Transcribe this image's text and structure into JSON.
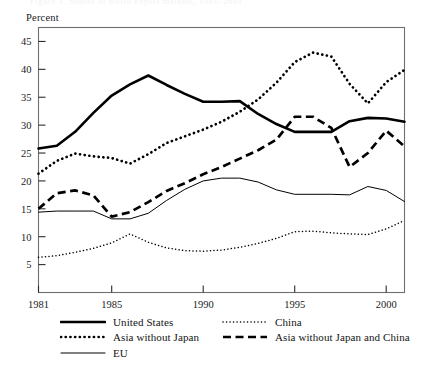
{
  "figure": {
    "ghost_title": "Figure 3. Shares of world export markets, 1981–2001",
    "y_axis_title": "Percent"
  },
  "legend": {
    "left_column": [
      {
        "label": "United States",
        "style": "solid-thick",
        "key": "united_states"
      },
      {
        "label": "Asia without Japan",
        "style": "dotted-thick",
        "key": "asia_without_japan"
      },
      {
        "label": "EU",
        "style": "solid-thin",
        "key": "eu"
      }
    ],
    "right_column": [
      {
        "label": "China",
        "style": "dotted-thin",
        "key": "china"
      },
      {
        "label": "Asia without Japan and China",
        "style": "dashed-thick",
        "key": "asia_without_japan_and_china"
      }
    ]
  },
  "chart_data": {
    "type": "line",
    "title": "",
    "xlabel": "",
    "ylabel": "Percent",
    "xlim": [
      1981,
      2001
    ],
    "ylim": [
      0,
      47.5
    ],
    "x_ticks": [
      1981,
      1985,
      1990,
      1995,
      2000
    ],
    "x_tick_labels": [
      "1981",
      "1985",
      "1990",
      "1995",
      "2000"
    ],
    "y_ticks": [
      5,
      10,
      15,
      20,
      25,
      30,
      35,
      40,
      45
    ],
    "y_tick_labels": [
      "5",
      "10",
      "15",
      "20",
      "25",
      "30",
      "35",
      "40",
      "45"
    ],
    "grid": false,
    "legend_position": "below-axes",
    "x": [
      1981,
      1982,
      1983,
      1984,
      1985,
      1986,
      1987,
      1988,
      1989,
      1990,
      1991,
      1992,
      1993,
      1994,
      1995,
      1996,
      1997,
      1998,
      1999,
      2000,
      2001
    ],
    "series": [
      {
        "name": "United States",
        "style": "solid-thick",
        "color": "#000000",
        "values": [
          25.8,
          26.3,
          28.8,
          32.2,
          35.3,
          37.3,
          38.9,
          37.2,
          35.6,
          34.2,
          34.2,
          34.3,
          32.0,
          30.2,
          28.8,
          28.8,
          28.8,
          30.7,
          31.3,
          31.2,
          30.6
        ]
      },
      {
        "name": "Asia without Japan",
        "style": "dotted-thick",
        "color": "#000000",
        "values": [
          21.3,
          23.6,
          24.9,
          24.4,
          24.1,
          23.1,
          24.8,
          26.8,
          28.0,
          29.2,
          30.6,
          32.4,
          34.6,
          37.6,
          41.3,
          43.0,
          42.3,
          37.4,
          33.9,
          37.7,
          39.9
        ]
      },
      {
        "name": "EU",
        "style": "solid-thin",
        "color": "#000000",
        "values": [
          14.4,
          14.6,
          14.6,
          14.6,
          13.2,
          13.2,
          14.2,
          16.5,
          18.5,
          20.0,
          20.5,
          20.5,
          19.8,
          18.4,
          17.6,
          17.6,
          17.6,
          17.5,
          19.0,
          18.3,
          16.3
        ]
      },
      {
        "name": "China",
        "style": "dotted-thin",
        "color": "#000000",
        "values": [
          6.3,
          6.6,
          7.2,
          7.9,
          8.9,
          10.5,
          9.0,
          8.0,
          7.5,
          7.4,
          7.6,
          8.1,
          8.8,
          9.7,
          10.9,
          11.0,
          10.7,
          10.5,
          10.4,
          11.4,
          12.9
        ]
      },
      {
        "name": "Asia without Japan and China",
        "style": "dashed-thick",
        "color": "#000000",
        "values": [
          15.0,
          17.8,
          18.3,
          17.4,
          13.6,
          14.4,
          16.2,
          18.2,
          19.6,
          21.2,
          22.5,
          24.0,
          25.5,
          27.4,
          31.5,
          31.5,
          29.5,
          22.5,
          25.0,
          29.0,
          26.2
        ]
      }
    ]
  }
}
